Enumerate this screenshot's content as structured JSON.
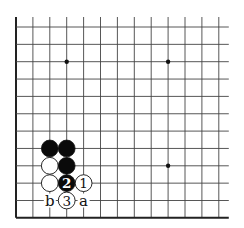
{
  "board": {
    "cols": 13,
    "rows": 12,
    "origin_x": 16,
    "origin_y": 27,
    "step_x": 16.9,
    "step_y": 17.35,
    "line_extend_right": 10,
    "line_extend_top": 10,
    "edges": [
      "left",
      "bottom"
    ],
    "line_color": "#444444",
    "edge_color": "#222222",
    "star_points": [
      [
        3,
        2
      ],
      [
        9,
        2
      ],
      [
        9,
        8
      ]
    ]
  },
  "stones": [
    {
      "col": 2,
      "row": 7,
      "color": "black",
      "label": ""
    },
    {
      "col": 3,
      "row": 7,
      "color": "black",
      "label": ""
    },
    {
      "col": 2,
      "row": 8,
      "color": "white",
      "label": ""
    },
    {
      "col": 3,
      "row": 8,
      "color": "black",
      "label": ""
    },
    {
      "col": 2,
      "row": 9,
      "color": "white",
      "label": ""
    },
    {
      "col": 3,
      "row": 9,
      "color": "black",
      "label": "2"
    },
    {
      "col": 4,
      "row": 9,
      "color": "white",
      "label": "1"
    },
    {
      "col": 3,
      "row": 10,
      "color": "white",
      "label": "3"
    }
  ],
  "markers": [
    {
      "col": 2,
      "row": 10,
      "label": "b"
    },
    {
      "col": 4,
      "row": 10,
      "label": "a"
    }
  ]
}
